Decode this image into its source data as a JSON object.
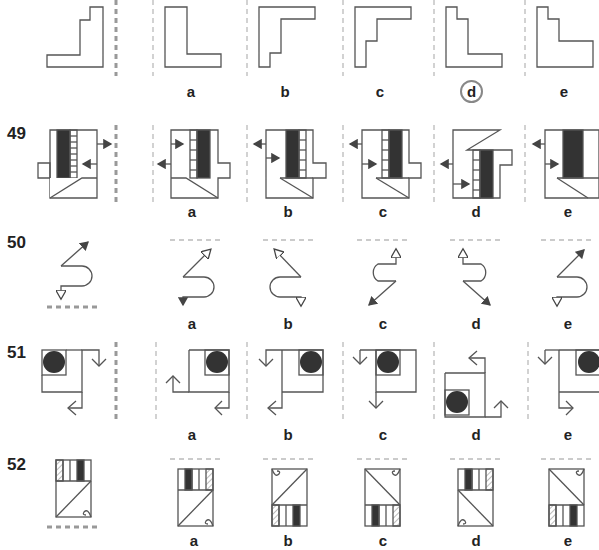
{
  "questions": [
    {
      "number": "",
      "options": [
        "a",
        "b",
        "c",
        "d",
        "e"
      ],
      "marked_answer": "d"
    },
    {
      "number": "49",
      "options": [
        "a",
        "b",
        "c",
        "d",
        "e"
      ]
    },
    {
      "number": "50",
      "options": [
        "a",
        "b",
        "c",
        "d",
        "e"
      ]
    },
    {
      "number": "51",
      "options": [
        "a",
        "b",
        "c",
        "d",
        "e"
      ]
    },
    {
      "number": "52",
      "options": [
        "a",
        "b",
        "c",
        "d",
        "e"
      ]
    }
  ],
  "colors": {
    "line": "#555555",
    "fill_dark": "#333333",
    "dash_thick": "#999999",
    "dash_thin": "#bbbbbb"
  }
}
